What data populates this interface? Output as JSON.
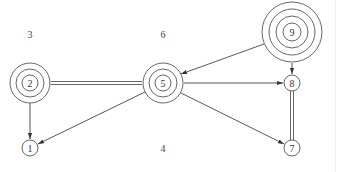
{
  "diagram": {
    "type": "directed-graph",
    "colors": {
      "stroke": "#555555",
      "text": "#333333",
      "background": "#ffffff"
    },
    "nodes": [
      {
        "id": "1",
        "label": "1",
        "x": 30,
        "y": 148,
        "rings": 1
      },
      {
        "id": "2",
        "label": "2",
        "x": 30,
        "y": 83,
        "rings": 3
      },
      {
        "id": "5",
        "label": "5",
        "x": 163,
        "y": 83,
        "rings": 3
      },
      {
        "id": "7",
        "label": "7",
        "x": 292,
        "y": 148,
        "rings": 1
      },
      {
        "id": "8",
        "label": "8",
        "x": 292,
        "y": 83,
        "rings": 1
      },
      {
        "id": "9",
        "label": "9",
        "x": 292,
        "y": 32,
        "rings": 4
      }
    ],
    "free_labels": [
      {
        "id": "3",
        "label": "3",
        "x": 30,
        "y": 34
      },
      {
        "id": "6",
        "label": "6",
        "x": 163,
        "y": 34
      },
      {
        "id": "4",
        "label": "4",
        "x": 163,
        "y": 148
      }
    ],
    "edges": [
      {
        "from": "2",
        "to": "5",
        "style": "double",
        "directed": false
      },
      {
        "from": "8",
        "to": "7",
        "style": "double",
        "directed": false
      },
      {
        "from": "2",
        "to": "1",
        "style": "arrow",
        "directed": true
      },
      {
        "from": "5",
        "to": "1",
        "style": "arrow",
        "directed": true
      },
      {
        "from": "5",
        "to": "8",
        "style": "arrow",
        "directed": true
      },
      {
        "from": "5",
        "to": "7",
        "style": "arrow",
        "directed": true
      },
      {
        "from": "9",
        "to": "5",
        "style": "arrow",
        "directed": true
      },
      {
        "from": "9",
        "to": "8",
        "style": "arrow",
        "directed": true
      }
    ]
  }
}
